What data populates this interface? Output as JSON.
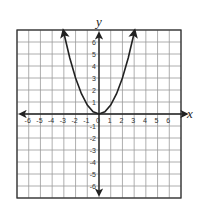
{
  "chart_data": {
    "type": "line",
    "title": "",
    "xlabel": "x",
    "ylabel": "y",
    "xlim": [
      -7,
      7
    ],
    "ylim": [
      -7,
      7
    ],
    "grid": true,
    "x_ticks": [
      -6,
      -5,
      -4,
      -3,
      -2,
      -1,
      0,
      1,
      2,
      3,
      4,
      5,
      6
    ],
    "y_ticks": [
      -6,
      -5,
      -4,
      -3,
      -2,
      -1,
      1,
      2,
      3,
      4,
      5,
      6
    ],
    "x_tick_labels": [
      "-6",
      "-5",
      "-4",
      "-3",
      "-2",
      "-1",
      "0",
      "1",
      "2",
      "3",
      "4",
      "5",
      "6"
    ],
    "y_tick_labels": [
      "-6",
      "-5",
      "-4",
      "-3",
      "-2",
      "-1",
      "1",
      "2",
      "3",
      "4",
      "5",
      "6"
    ],
    "series": [
      {
        "name": "parabola",
        "equation": "y = 0.75x^2",
        "x": [
          -3.05,
          -3,
          -2.5,
          -2,
          -1.5,
          -1,
          -0.5,
          0,
          0.5,
          1,
          1.5,
          2,
          2.5,
          3,
          3.05
        ],
        "y": [
          6.98,
          6.75,
          4.69,
          3,
          1.69,
          0.75,
          0.19,
          0,
          0.19,
          0.75,
          1.69,
          3,
          4.69,
          6.75,
          6.98
        ],
        "arrows": "both ends",
        "color": "#222222"
      }
    ],
    "colors": {
      "grid": "#9a9a9a",
      "axis": "#222222",
      "border": "#333333",
      "curve": "#222222"
    }
  }
}
